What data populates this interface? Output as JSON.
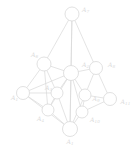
{
  "figure": {
    "type": "node-link-graph",
    "background_color": "#ffffff",
    "edge_color": "#d8d8d8",
    "node_fill_color": "#ffffff",
    "node_stroke_color": "#d4d4d4",
    "label_color": "#dcdcdc",
    "width": 139,
    "height": 147
  },
  "chart_data": {
    "type": "graph",
    "title": "",
    "node_count": 13,
    "edge_count": 28,
    "nodes": [
      {
        "id": "A7",
        "label": "A",
        "sub": "7",
        "cx": 72.0,
        "cy": 14.0,
        "r": 7.0,
        "label_x": 82.0,
        "label_y": 10.0
      },
      {
        "id": "A6",
        "label": "A",
        "sub": "6",
        "cx": 44.0,
        "cy": 64.0,
        "r": 7.0,
        "label_x": 31.0,
        "label_y": 55.5
      },
      {
        "id": "A2",
        "label": "A",
        "sub": "2",
        "cx": 71.0,
        "cy": 73.0,
        "r": 7.5,
        "label_x": 82.0,
        "label_y": 65.5
      },
      {
        "id": "A8",
        "label": "A",
        "sub": "8",
        "cx": 96.0,
        "cy": 68.0,
        "r": 6.5,
        "label_x": 108.0,
        "label_y": 65.5
      },
      {
        "id": "A1v",
        "label": "A",
        "sub": "1",
        "cx": 23.0,
        "cy": 93.0,
        "r": 6.5,
        "label_x": 11.0,
        "label_y": 98.5
      },
      {
        "id": "A3",
        "label": "A",
        "sub": "3",
        "cx": 57.0,
        "cy": 93.0,
        "r": 6.0,
        "label_x": 45.0,
        "label_y": 88.5
      },
      {
        "id": "A9",
        "label": "A",
        "sub": "9",
        "cx": 85.0,
        "cy": 95.0,
        "r": 6.0,
        "label_x": 92.5,
        "label_y": 99.0
      },
      {
        "id": "A11",
        "label": "A",
        "sub": "11",
        "cx": 110.0,
        "cy": 99.0,
        "r": 6.5,
        "label_x": 120.5,
        "label_y": 102.5
      },
      {
        "id": "A4",
        "label": "A",
        "sub": "4",
        "cx": 48.0,
        "cy": 110.0,
        "r": 6.0,
        "label_x": 37.0,
        "label_y": 119.5
      },
      {
        "id": "A10",
        "label": "A",
        "sub": "10",
        "cx": 82.0,
        "cy": 112.0,
        "r": 6.0,
        "label_x": 90.0,
        "label_y": 120.0
      },
      {
        "id": "A1",
        "label": "A",
        "sub": "1",
        "cx": 70.0,
        "cy": 129.0,
        "r": 7.5,
        "label_x": 66.5,
        "label_y": 142.5
      },
      {
        "id": "U1",
        "label": "",
        "sub": "",
        "cx": 63.0,
        "cy": 110.0,
        "r": 0.0,
        "label_x": 0.0,
        "label_y": 0.0
      },
      {
        "id": "U2",
        "label": "",
        "sub": "",
        "cx": 98.0,
        "cy": 88.0,
        "r": 0.0,
        "label_x": 0.0,
        "label_y": 0.0
      }
    ],
    "edges": [
      {
        "from": "A7",
        "to": "A6"
      },
      {
        "from": "A7",
        "to": "A2"
      },
      {
        "from": "A7",
        "to": "A1"
      },
      {
        "from": "A7",
        "to": "A8"
      },
      {
        "from": "A6",
        "to": "A2"
      },
      {
        "from": "A6",
        "to": "A1v"
      },
      {
        "from": "A6",
        "to": "A3"
      },
      {
        "from": "A6",
        "to": "A4"
      },
      {
        "from": "A2",
        "to": "A8"
      },
      {
        "from": "A2",
        "to": "A3"
      },
      {
        "from": "A2",
        "to": "A9"
      },
      {
        "from": "A2",
        "to": "A4"
      },
      {
        "from": "A2",
        "to": "A10"
      },
      {
        "from": "A2",
        "to": "A1"
      },
      {
        "from": "A2",
        "to": "A1v"
      },
      {
        "from": "A8",
        "to": "A9"
      },
      {
        "from": "A8",
        "to": "A11"
      },
      {
        "from": "A1v",
        "to": "A3"
      },
      {
        "from": "A1v",
        "to": "A4"
      },
      {
        "from": "A3",
        "to": "A4"
      },
      {
        "from": "A3",
        "to": "A1"
      },
      {
        "from": "A9",
        "to": "A11"
      },
      {
        "from": "A9",
        "to": "A10"
      },
      {
        "from": "A9",
        "to": "A1"
      },
      {
        "from": "A11",
        "to": "A10"
      },
      {
        "from": "A4",
        "to": "A1"
      },
      {
        "from": "A10",
        "to": "A1"
      },
      {
        "from": "A1v",
        "to": "A1"
      }
    ]
  }
}
